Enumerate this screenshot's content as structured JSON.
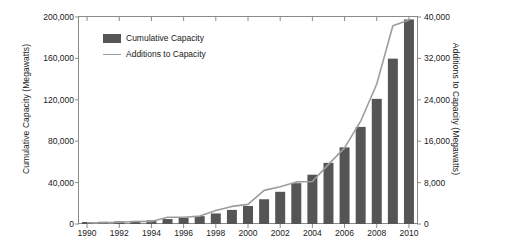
{
  "chart_data": {
    "type": "bar",
    "title": "",
    "subtitle": "",
    "xlabel": "",
    "ylabel": "Cumulative Capacity (Megawatts)",
    "y2label": "Additions to Capacity (Megawatts)",
    "grid": false,
    "legend_position": "top-left",
    "categories": [
      "1990",
      "1991",
      "1992",
      "1993",
      "1994",
      "1995",
      "1996",
      "1997",
      "1998",
      "1999",
      "2000",
      "2001",
      "2002",
      "2003",
      "2004",
      "2005",
      "2006",
      "2007",
      "2008",
      "2009",
      "2010"
    ],
    "x_tick_labels": [
      "1990",
      "1992",
      "1994",
      "1996",
      "1998",
      "2000",
      "2002",
      "2004",
      "2006",
      "2008",
      "2010"
    ],
    "ylim": [
      0,
      200000
    ],
    "y_ticks": [
      0,
      40000,
      80000,
      120000,
      160000,
      200000
    ],
    "y_tick_labels": [
      "0",
      "40,000",
      "80,000",
      "120,000",
      "160,000",
      "200,000"
    ],
    "y2lim": [
      0,
      40000
    ],
    "y2_ticks": [
      0,
      8000,
      16000,
      24000,
      32000,
      40000
    ],
    "y2_tick_labels": [
      "0",
      "8,000",
      "16,000",
      "24,000",
      "32,000",
      "40,000"
    ],
    "series": [
      {
        "name": "Cumulative Capacity",
        "type": "bar",
        "axis": "left",
        "color": "#555555",
        "values": [
          1930,
          2170,
          2510,
          2990,
          3490,
          4780,
          6070,
          7600,
          10200,
          13600,
          17400,
          23900,
          31100,
          39431,
          47620,
          59091,
          74052,
          93820,
          120903,
          159766,
          197637
        ]
      },
      {
        "name": "Additions to Capacity",
        "type": "line",
        "axis": "right",
        "color": "#9d9d9d",
        "values": [
          240,
          240,
          340,
          480,
          500,
          1290,
          1290,
          1530,
          2600,
          3400,
          3800,
          6500,
          7200,
          8133,
          8207,
          11531,
          14703,
          19865,
          27056,
          38312,
          39404
        ]
      }
    ]
  },
  "legend": {
    "items": [
      {
        "label": "Cumulative Capacity",
        "marker": "bar-swatch"
      },
      {
        "label": "Additions to Capacity",
        "marker": "line-swatch"
      }
    ]
  }
}
